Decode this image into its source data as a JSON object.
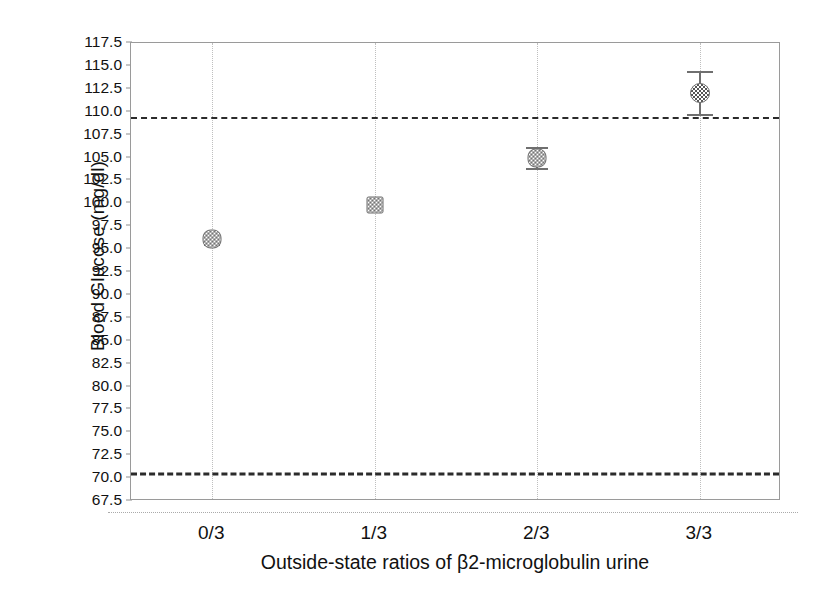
{
  "chart_data": {
    "type": "scatter",
    "title": "",
    "xlabel": "Outside-state ratios of β2-microglobulin urine",
    "ylabel": "Blood Glucose (mg/dl)",
    "categories": [
      "0/3",
      "1/3",
      "2/3",
      "3/3"
    ],
    "values": [
      96.1,
      99.8,
      105.0,
      112.0
    ],
    "error_low": [
      95.6,
      99.4,
      103.9,
      109.8
    ],
    "error_high": [
      96.7,
      100.3,
      106.1,
      114.4
    ],
    "marker_shapes": [
      "diamond",
      "square",
      "diamond",
      "circle"
    ],
    "ylim": [
      67.5,
      117.5
    ],
    "ytick_labels": [
      "117.5",
      "115.0",
      "112.5",
      "110.0",
      "107.5",
      "105.0",
      "102.5",
      "100.0",
      "97.5",
      "95.0",
      "92.5",
      "90.0",
      "87.5",
      "85.0",
      "82.5",
      "80.0",
      "77.5",
      "75.0",
      "72.5",
      "70.0",
      "67.5"
    ],
    "ytick_values": [
      117.5,
      115.0,
      112.5,
      110.0,
      107.5,
      105.0,
      102.5,
      100.0,
      97.5,
      95.0,
      92.5,
      90.0,
      87.5,
      85.0,
      82.5,
      80.0,
      77.5,
      75.0,
      72.5,
      70.0,
      67.5
    ],
    "reference_lines": [
      {
        "name": "upper-reference-line",
        "value": 109.3
      },
      {
        "name": "lower-reference-line",
        "value": 70.4
      }
    ],
    "grid": {
      "vertical": true,
      "horizontal": false
    },
    "legend": null,
    "colors": {
      "marker_fill": "#555555",
      "marker_edge": "#6a6a6a",
      "error_bar": "#6f6f6f",
      "reference_line": "#2b2b2b",
      "grid": "#bfbfbf",
      "frame": "#9a9a9a",
      "text": "#111111"
    }
  }
}
